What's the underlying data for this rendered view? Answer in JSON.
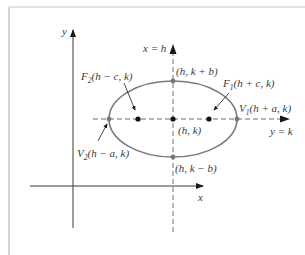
{
  "figure": {
    "axes": {
      "x_label": "x",
      "y_label": "y"
    },
    "lines": {
      "vertical_axis_label": "x = h",
      "horizontal_axis_label": "y = k"
    },
    "points": {
      "center": "(h, k)",
      "top": "(h, k + b)",
      "bottom": "(h, k − b)",
      "focus1_name": "F",
      "focus1_sub": "1",
      "focus1_coords": "(h + c, k)",
      "focus2_name": "F",
      "focus2_sub": "2",
      "focus2_coords": "(h − c, k)",
      "vertex1_name": "V",
      "vertex1_sub": "1",
      "vertex1_coords": "(h + a, k)",
      "vertex2_name": "V",
      "vertex2_sub": "2",
      "vertex2_coords": "(h − a, k)"
    },
    "colors": {
      "ink": "#2b2b2b",
      "ellipse": "#7a7a7a",
      "dashed": "#8a8a8a",
      "frame": "#c8c8c8"
    }
  }
}
